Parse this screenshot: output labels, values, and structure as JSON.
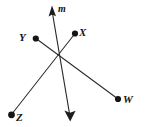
{
  "figure": {
    "kind": "geometry-line-diagram",
    "background_color": "#ffffff",
    "stroke_color": "#2b2b2b",
    "label_color": "#151515",
    "intersection_point": {
      "x": 60,
      "y": 61
    },
    "labels": [
      {
        "id": "m",
        "text": "m",
        "kind": "line-label",
        "x": 63,
        "y": 9
      },
      {
        "id": "x",
        "text": "X",
        "kind": "point-label",
        "x": 84,
        "y": 33
      },
      {
        "id": "y",
        "text": "Y",
        "kind": "point-label",
        "x": 23,
        "y": 38
      },
      {
        "id": "w",
        "text": "W",
        "kind": "point-label",
        "x": 129,
        "y": 100
      },
      {
        "id": "z",
        "text": "Z",
        "kind": "point-label",
        "x": 21,
        "y": 118
      }
    ],
    "points": [
      {
        "id": "x",
        "label": "X",
        "x": 75,
        "y": 33
      },
      {
        "id": "y",
        "label": "Y",
        "x": 36,
        "y": 38
      },
      {
        "id": "w",
        "label": "W",
        "x": 118,
        "y": 99
      },
      {
        "id": "z",
        "label": "Z",
        "x": 11,
        "y": 115
      }
    ],
    "lines": [
      {
        "id": "line-m",
        "label": "m",
        "from": {
          "x": 52,
          "y": 8
        },
        "to": {
          "x": 70,
          "y": 119
        },
        "arrow_start": true,
        "arrow_end": true
      },
      {
        "id": "segment-yw",
        "label": "YW",
        "from": {
          "x": 36,
          "y": 38
        },
        "to": {
          "x": 118,
          "y": 99
        },
        "arrow_start": false,
        "arrow_end": false
      },
      {
        "id": "segment-xz",
        "label": "XZ",
        "from": {
          "x": 75,
          "y": 33
        },
        "to": {
          "x": 11,
          "y": 115
        },
        "arrow_start": false,
        "arrow_end": false
      }
    ]
  }
}
